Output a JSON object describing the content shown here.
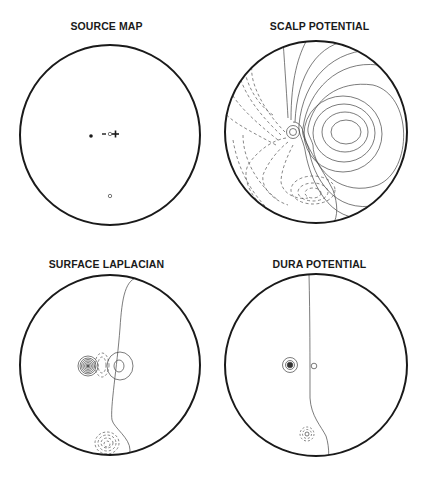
{
  "figure": {
    "panels": [
      {
        "id": "source-map",
        "title": "SOURCE MAP",
        "markers": [
          {
            "symbol": "•",
            "meaning": "filled dot"
          },
          {
            "symbol": "-",
            "meaning": "negative pole"
          },
          {
            "symbol": "o",
            "meaning": "open circle"
          },
          {
            "symbol": "+",
            "meaning": "positive pole"
          },
          {
            "symbol": "o",
            "meaning": "lower open circle"
          }
        ]
      },
      {
        "id": "scalp-potential",
        "title": "SCALP POTENTIAL"
      },
      {
        "id": "surface-laplacian",
        "title": "SURFACE LAPLACIAN"
      },
      {
        "id": "dura-potential",
        "title": "DURA POTENTIAL"
      }
    ],
    "colors": {
      "outline": "#1a1a1a",
      "contour": "#444444",
      "background": "#ffffff"
    }
  }
}
